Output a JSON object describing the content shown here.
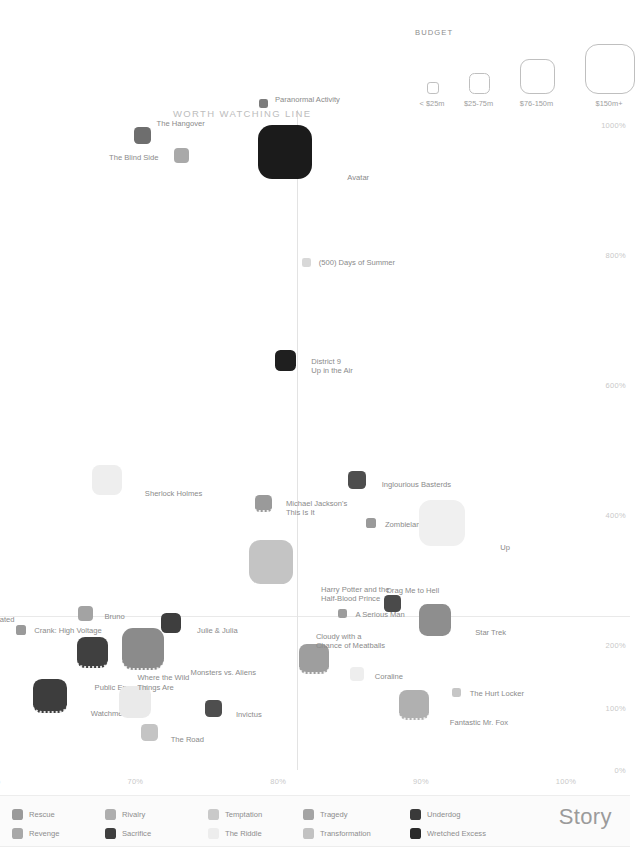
{
  "chart_data": {
    "type": "scatter",
    "title": "",
    "xlabel": "",
    "ylabel": "",
    "xticks": [
      "55%",
      "60%",
      "70%",
      "80%",
      "90%",
      "100%"
    ],
    "yticks": [
      "1000%",
      "800%",
      "600%",
      "400%",
      "200%",
      "100%",
      "0%"
    ],
    "xlim": [
      54,
      101
    ],
    "ylim": [
      0,
      1050
    ],
    "grid": true,
    "legend_position": "bottom",
    "size_encoding": "budget",
    "color_encoding": "story",
    "annotations": [
      {
        "text": "WORTH WATCHING LINE"
      }
    ],
    "points": [
      {
        "label": "Paranormal Activity",
        "x": 79.0,
        "y": 1035,
        "story": "Underdog",
        "budget": "<$25m",
        "size": 9,
        "color": "#7c7c7c",
        "lx": 11,
        "ly": -3,
        "dotted": false
      },
      {
        "label": "Avatar",
        "x": 80.5,
        "y": 960,
        "story": "Wretched Excess",
        "budget": "$150m+",
        "size": 54,
        "color": "#1b1b1b",
        "lx": 62,
        "ly": 26,
        "dotted": false
      },
      {
        "label": "The Hangover",
        "x": 70.5,
        "y": 985,
        "story": "Rivalry",
        "budget": "$25-75m",
        "size": 17,
        "color": "#6e6e6e",
        "lx": 14,
        "ly": -12,
        "dotted": false
      },
      {
        "label": "The Blind Side",
        "x": 73.2,
        "y": 955,
        "story": "Temptation",
        "budget": "$25-75m",
        "size": 15,
        "color": "#a9a9a9",
        "lx": -72,
        "ly": 3,
        "dotted": false
      },
      {
        "label": "Taken",
        "x": 56.8,
        "y": 865,
        "story": "Rescue",
        "budget": "$25-75m",
        "size": 16,
        "color": "#9a9a9a",
        "lx": 20,
        "ly": 3,
        "dotted": false
      },
      {
        "label": "My Bloody\nValentine 3D",
        "x": 54.2,
        "y": 725,
        "story": "Tragedy",
        "budget": "<$25m",
        "size": 10,
        "color": "#a0a0a0",
        "lx": 7,
        "ly": -5,
        "dotted": false
      },
      {
        "label": "17 Again",
        "x": 57.3,
        "y": 665,
        "story": "Transformation",
        "budget": "$25-75m",
        "size": 11,
        "color": "#9a9a9a",
        "lx": 15,
        "ly": 2,
        "dotted": false
      },
      {
        "label": "(500) Days of Summer",
        "x": 82.0,
        "y": 790,
        "story": "The Riddle",
        "budget": "<$25m",
        "size": 9,
        "color": "#d8d8d8",
        "lx": 12,
        "ly": 0,
        "dotted": false
      },
      {
        "label": "District 9\nUp in the Air",
        "x": 80.5,
        "y": 640,
        "story": "Wretched Excess",
        "budget": "$25-75m",
        "size": 21,
        "color": "#1f1f1f",
        "lx": 26,
        "ly": 2,
        "dotted": false
      },
      {
        "label": "Sherlock Holmes",
        "x": 68.0,
        "y": 455,
        "story": "The Riddle",
        "budget": "$76-150m",
        "size": 30,
        "color": "#eeeeee",
        "lx": 38,
        "ly": 14,
        "dotted": false
      },
      {
        "label": "Inglourious Basterds",
        "x": 85.5,
        "y": 455,
        "story": "Sacrifice",
        "budget": "$25-75m",
        "size": 18,
        "color": "#4e4e4e",
        "lx": 25,
        "ly": 5,
        "dotted": false
      },
      {
        "label": "Michael Jackson's\nThis Is It",
        "x": 79.0,
        "y": 420,
        "story": "Rescue",
        "budget": "$25-75m",
        "size": 17,
        "color": "#9a9a9a",
        "lx": 22,
        "ly": 1,
        "dotted": true
      },
      {
        "label": "Zombieland",
        "x": 86.5,
        "y": 390,
        "story": "Rescue",
        "budget": "<$25m",
        "size": 10,
        "color": "#9a9a9a",
        "lx": 14,
        "ly": 2,
        "dotted": false
      },
      {
        "label": "Harry Potter and the\nHalf-Blood Prince",
        "x": 79.5,
        "y": 330,
        "story": "Temptation",
        "budget": "$150m+",
        "size": 44,
        "color": "#c4c4c4",
        "lx": 50,
        "ly": 28,
        "dotted": false
      },
      {
        "label": "Up",
        "x": 91.5,
        "y": 390,
        "story": "The Riddle",
        "budget": "$150m+",
        "size": 46,
        "color": "#f0f0f0",
        "lx": 58,
        "ly": 25,
        "dotted": false
      },
      {
        "label": "It's Complicated",
        "x": 56.5,
        "y": 245,
        "story": "Temptation",
        "budget": "$25-75m",
        "size": 14,
        "color": "#cccccc",
        "lx": 18,
        "ly": 3,
        "dotted": false
      },
      {
        "label": "Bruno",
        "x": 66.5,
        "y": 250,
        "story": "Rivalry",
        "budget": "$25-75m",
        "size": 15,
        "color": "#a3a3a3",
        "lx": 19,
        "ly": 3,
        "dotted": false
      },
      {
        "label": "A Serious Man",
        "x": 84.5,
        "y": 250,
        "story": "Rescue",
        "budget": "<$25m",
        "size": 9,
        "color": "#9c9c9c",
        "lx": 13,
        "ly": 1,
        "dotted": false
      },
      {
        "label": "Drag Me to Hell",
        "x": 88.0,
        "y": 265,
        "story": "Sacrifice",
        "budget": "$25-75m",
        "size": 17,
        "color": "#4a4a4a",
        "lx": -6,
        "ly": -13,
        "dotted": false
      },
      {
        "label": "Star Trek",
        "x": 91.0,
        "y": 240,
        "story": "Rescue",
        "budget": "$76-150m",
        "size": 32,
        "color": "#8e8e8e",
        "lx": 40,
        "ly": 13,
        "dotted": false
      },
      {
        "label": "Crank: High Voltage",
        "x": 62.0,
        "y": 225,
        "story": "Revenge",
        "budget": "<$25m",
        "size": 10,
        "color": "#9a9a9a",
        "lx": 13,
        "ly": 1,
        "dotted": false
      },
      {
        "label": "Julie & Julia",
        "x": 72.5,
        "y": 235,
        "story": "Sacrifice",
        "budget": "$25-75m",
        "size": 20,
        "color": "#3e3e3e",
        "lx": 26,
        "ly": 8,
        "dotted": false
      },
      {
        "label": "Monsters vs. Aliens",
        "x": 70.5,
        "y": 195,
        "story": "Rivalry",
        "budget": "$150m+",
        "size": 42,
        "color": "#8b8b8b",
        "lx": 48,
        "ly": 24,
        "dotted": true
      },
      {
        "label": "Public Enemies",
        "x": 67.0,
        "y": 190,
        "story": "Sacrifice",
        "budget": "$76-150m",
        "size": 31,
        "color": "#404040",
        "lx": 2,
        "ly": 36,
        "dotted": true
      },
      {
        "label": "Cloudy with a\nChance of Meatballs",
        "x": 82.5,
        "y": 180,
        "story": "Rivalry",
        "budget": "$76-150m",
        "size": 30,
        "color": "#9e9e9e",
        "lx": 2,
        "ly": -22,
        "dotted": true
      },
      {
        "label": "Coraline",
        "x": 85.5,
        "y": 155,
        "story": "The Riddle",
        "budget": "$25-75m",
        "size": 14,
        "color": "#eeeeee",
        "lx": 18,
        "ly": 3,
        "dotted": false
      },
      {
        "label": "A Christmas\nCarol",
        "x": 54.0,
        "y": 160,
        "story": "Transformation",
        "budget": "$150m+",
        "size": 38,
        "color": "#c0c0c0",
        "lx": 10,
        "ly": 14,
        "dotted": false
      },
      {
        "label": "Watchmen",
        "x": 64.0,
        "y": 120,
        "story": "Sacrifice",
        "budget": "$150m+",
        "size": 34,
        "color": "#3d3d3d",
        "lx": 41,
        "ly": 18,
        "dotted": true
      },
      {
        "label": "Where the Wild\nThings Are",
        "x": 70.0,
        "y": 110,
        "story": "The Riddle",
        "budget": "$76-150m",
        "size": 32,
        "color": "#eaeaea",
        "lx": 2,
        "ly": -24,
        "dotted": false
      },
      {
        "label": "Invictus",
        "x": 75.5,
        "y": 100,
        "story": "Sacrifice",
        "budget": "$25-75m",
        "size": 17,
        "color": "#4e4e4e",
        "lx": 22,
        "ly": 6,
        "dotted": false
      },
      {
        "label": "The Road",
        "x": 71.0,
        "y": 62,
        "story": "Temptation",
        "budget": "$25-75m",
        "size": 17,
        "color": "#c4c4c4",
        "lx": 21,
        "ly": 8,
        "dotted": false
      },
      {
        "label": "The Soloist",
        "x": 54.0,
        "y": 55,
        "story": "Transformation",
        "budget": "$25-75m",
        "size": 14,
        "color": "#bdbdbd",
        "lx": 6,
        "ly": 4,
        "dotted": false
      },
      {
        "label": "Fantastic Mr. Fox",
        "x": 89.5,
        "y": 105,
        "story": "Rivalry",
        "budget": "$76-150m",
        "size": 30,
        "color": "#b0b0b0",
        "lx": 36,
        "ly": 18,
        "dotted": true
      },
      {
        "label": "The Hurt Locker",
        "x": 92.5,
        "y": 125,
        "story": "Temptation",
        "budget": "<$25m",
        "size": 9,
        "color": "#c6c6c6",
        "lx": 13,
        "ly": 1,
        "dotted": false
      }
    ]
  },
  "worth_watching": {
    "label": "WORTH WATCHING LINE"
  },
  "budget_legend": {
    "title": "BUDGET",
    "items": [
      {
        "label": "< $25m",
        "size": 10
      },
      {
        "label": "$25-75m",
        "size": 19
      },
      {
        "label": "$76-150m",
        "size": 33
      },
      {
        "label": "$150m+",
        "size": 48
      }
    ]
  },
  "story_legend": {
    "heading": "Story",
    "items": [
      {
        "label": "Rescue",
        "color": "#9a9a9a"
      },
      {
        "label": "Revenge",
        "color": "#a8a8a8"
      },
      {
        "label": "Rivalry",
        "color": "#aeaeae"
      },
      {
        "label": "Sacrifice",
        "color": "#3f3f3f"
      },
      {
        "label": "Temptation",
        "color": "#c9c9c9"
      },
      {
        "label": "The Riddle",
        "color": "#ededed"
      },
      {
        "label": "Tragedy",
        "color": "#a4a4a4"
      },
      {
        "label": "Transformation",
        "color": "#c2c2c2"
      },
      {
        "label": "Underdog",
        "color": "#3a3a3a"
      },
      {
        "label": "Wretched Excess",
        "color": "#2a2a2a"
      }
    ]
  }
}
